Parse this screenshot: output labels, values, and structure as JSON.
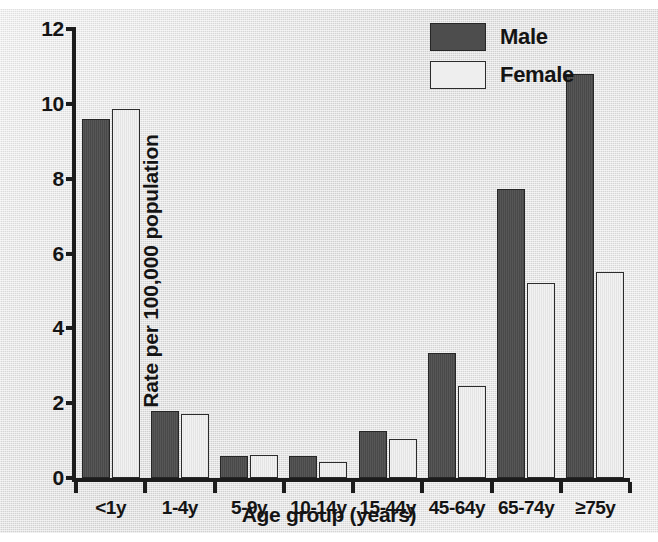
{
  "chart_data": {
    "type": "bar",
    "title": "",
    "xlabel": "Age group (years)",
    "ylabel": "Rate per 100,000 population",
    "categories": [
      "<1y",
      "1-4y",
      "5-9y",
      "10-14y",
      "15-44y",
      "45-64y",
      "65-74y",
      "≥75y"
    ],
    "series": [
      {
        "name": "Male",
        "color": "#4d4d4d",
        "values": [
          9.6,
          1.78,
          0.6,
          0.6,
          1.25,
          3.35,
          7.72,
          10.8
        ]
      },
      {
        "name": "Female",
        "color": "#ebebeb",
        "values": [
          9.85,
          1.72,
          0.62,
          0.42,
          1.05,
          2.45,
          5.22,
          5.5
        ]
      }
    ],
    "ylim": [
      0,
      12
    ],
    "yticks": [
      0,
      2,
      4,
      6,
      8,
      10,
      12
    ],
    "ytick_labels": [
      "0",
      "2",
      "4",
      "6",
      "8",
      "10",
      "12"
    ],
    "grid": false,
    "legend_position": "top-right",
    "legend_entries": [
      "Male",
      "Female"
    ]
  },
  "legend": {
    "male_label": "Male",
    "female_label": "Female"
  },
  "axes": {
    "y_title": "Rate per 100,000 population",
    "x_title": "Age group (years)"
  }
}
